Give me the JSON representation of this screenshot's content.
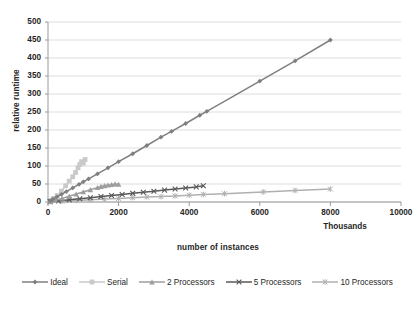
{
  "chart_data": {
    "type": "line",
    "title": "",
    "xlabel": "number of  instances",
    "ylabel": "relative runtime",
    "x_units_label": "Thousands",
    "xlim": [
      0,
      10000
    ],
    "ylim": [
      0,
      500
    ],
    "xticks": [
      "0",
      "2000",
      "4000",
      "6000",
      "8000",
      "10000"
    ],
    "yticks": [
      "0",
      "50",
      "100",
      "150",
      "200",
      "250",
      "300",
      "350",
      "400",
      "450",
      "500"
    ],
    "grid": "horizontal",
    "legend_position": "bottom",
    "series": [
      {
        "name": "Ideal",
        "marker": "diamond",
        "color": "#7f7f7f",
        "x": [
          60,
          140,
          250,
          380,
          520,
          700,
          880,
          1000,
          1150,
          1400,
          1700,
          2000,
          2400,
          2800,
          3200,
          3500,
          3900,
          4300,
          4500,
          6000,
          7000,
          8000
        ],
        "y": [
          3,
          8,
          14,
          21,
          29,
          39,
          49,
          56,
          64,
          78,
          95,
          112,
          134,
          157,
          180,
          196,
          218,
          241,
          252,
          336,
          392,
          450
        ]
      },
      {
        "name": "Serial",
        "marker": "square",
        "color": "#c9c9c9",
        "x": [
          60,
          150,
          260,
          380,
          500,
          600,
          700,
          780,
          850,
          900,
          950,
          1000,
          1050
        ],
        "y": [
          4,
          10,
          18,
          30,
          45,
          58,
          70,
          82,
          95,
          104,
          112,
          108,
          118
        ]
      },
      {
        "name": "2 Processors",
        "marker": "triangle",
        "color": "#9e9e9e",
        "x": [
          60,
          200,
          400,
          600,
          800,
          1000,
          1200,
          1400,
          1500,
          1600,
          1700,
          1800,
          1900,
          2000
        ],
        "y": [
          2,
          5,
          10,
          16,
          22,
          28,
          34,
          40,
          43,
          45,
          47,
          48,
          50,
          49
        ]
      },
      {
        "name": "5 Processors",
        "marker": "x",
        "color": "#595959",
        "x": [
          60,
          300,
          600,
          900,
          1200,
          1500,
          1800,
          2100,
          2400,
          2700,
          3000,
          3300,
          3600,
          3900,
          4200,
          4400
        ],
        "y": [
          1,
          3,
          6,
          9,
          12,
          15,
          18,
          21,
          24,
          27,
          30,
          33,
          36,
          39,
          42,
          45
        ]
      },
      {
        "name": "10 Processors",
        "marker": "asterisk",
        "color": "#b0b0b0",
        "x": [
          60,
          400,
          800,
          1200,
          1600,
          2000,
          2400,
          2800,
          3200,
          3600,
          4000,
          4400,
          5000,
          6100,
          7000,
          8000
        ],
        "y": [
          1,
          2,
          4,
          6,
          8,
          10,
          12,
          14,
          15,
          17,
          19,
          21,
          23,
          28,
          32,
          36
        ]
      }
    ]
  },
  "legend": {
    "items": [
      {
        "label": "Ideal"
      },
      {
        "label": "Serial"
      },
      {
        "label": "2 Processors"
      },
      {
        "label": "5 Processors"
      },
      {
        "label": "10 Processors"
      }
    ]
  }
}
